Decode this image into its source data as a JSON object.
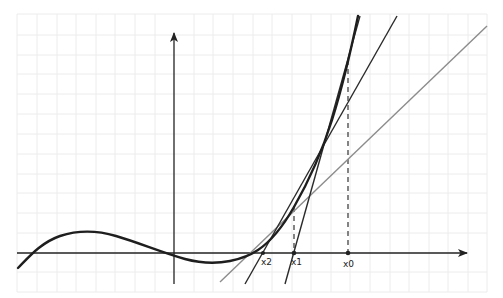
{
  "diagram": {
    "title": "",
    "type": "newton-method-illustration",
    "colors": {
      "background": "#ffffff",
      "grid": "#ebebeb",
      "axis": "#222222",
      "curve": "#1e1e1e",
      "tangent": "#2a2a2a",
      "secant_gray": "#8c8c8c",
      "dashed": "#333333"
    },
    "axes": {
      "x_axis": {
        "arrow": "right"
      },
      "y_axis": {
        "arrow": "up"
      }
    },
    "points": [
      {
        "id": "x0",
        "label": "x0"
      },
      {
        "id": "x1",
        "label": "x1"
      },
      {
        "id": "x2",
        "label": "x2"
      }
    ],
    "elements": [
      "grid",
      "x-axis",
      "y-axis",
      "function-curve",
      "tangent-at-x0",
      "tangent-at-x1",
      "gray-line",
      "dashed-drop-x0",
      "dashed-drop-x1"
    ]
  }
}
